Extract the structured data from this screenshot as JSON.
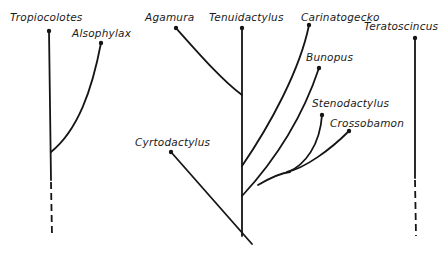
{
  "diagram": {
    "type": "phylogenetic-tree",
    "taxa": [
      {
        "id": "tropiocolotes",
        "label": "Tropiocolotes"
      },
      {
        "id": "alsophylax",
        "label": "Alsophylax"
      },
      {
        "id": "agamura",
        "label": "Agamura"
      },
      {
        "id": "tenuidactylus",
        "label": "Tenuidactylus"
      },
      {
        "id": "carinatogecko",
        "label": "Carinatogecko"
      },
      {
        "id": "bunopus",
        "label": "Bunopus"
      },
      {
        "id": "stenodactylus",
        "label": "Stenodactylus"
      },
      {
        "id": "crossobamon",
        "label": "Crossobamon"
      },
      {
        "id": "cyrtodactylus",
        "label": "Cyrtodactylus"
      },
      {
        "id": "teratoscincus",
        "label": "Teratoscincus"
      }
    ],
    "groups": [
      {
        "name": "left-clade",
        "members": [
          "Tropiocolotes",
          "Alsophylax"
        ],
        "base": "dashed"
      },
      {
        "name": "central-clade",
        "members": [
          "Agamura",
          "Tenuidactylus",
          "Carinatogecko",
          "Bunopus",
          "Stenodactylus",
          "Crossobamon",
          "Cyrtodactylus"
        ]
      },
      {
        "name": "right-lineage",
        "members": [
          "Teratoscincus"
        ],
        "base": "dashed"
      }
    ]
  }
}
